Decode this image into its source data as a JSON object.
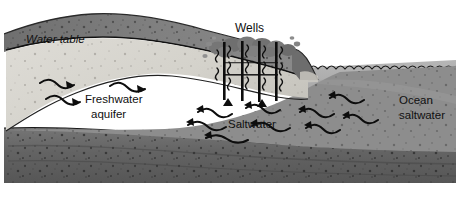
{
  "figure": {
    "name": "saltwater-intrusion-coastal-aquifer-diagram",
    "type": "grayscale-cross-section-illustration",
    "width": 464,
    "height": 199
  },
  "labels": {
    "water_table": "Water table",
    "wells": "Wells",
    "freshwater_aquifer_line1": "Freshwater",
    "freshwater_aquifer_line2": "aquifer",
    "saltwater": "Saltwater",
    "ocean_line1": "Ocean",
    "ocean_line2": "saltwater"
  },
  "colors": {
    "page_background": "#ffffff",
    "topsoil": "#7b7b7b",
    "topsoil_dark": "#5e5e5e",
    "unsaturated_zone": "#9a9a9a",
    "freshwater_lens": "#d8d6d0",
    "saltwater_wedge": "#8d8d8d",
    "ocean_water": "#a5a5a5",
    "bedrock": "#6a6a6a",
    "bedrock_dark": "#4f4f4f",
    "ink": "#101010",
    "well_pipe": "#0d0d0d"
  },
  "features": {
    "well_count": 4,
    "well_labels_visible": true,
    "ocean_surface": "scalloped-wave-line",
    "flow_arrows": {
      "freshwater_direction": "seaward",
      "saltwater_direction": "landward-toward-wells"
    }
  }
}
